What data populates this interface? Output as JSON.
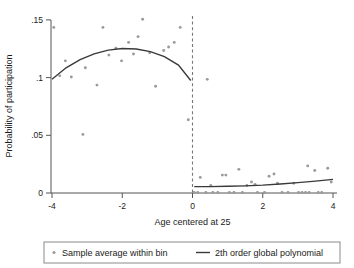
{
  "chart_data": {
    "type": "scatter",
    "title": "",
    "xlabel": "Age centered at 25",
    "ylabel": "Probability of participation",
    "xlim": [
      -4.2,
      4.2
    ],
    "ylim": [
      0,
      0.158
    ],
    "xticks": [
      -4,
      -2,
      0,
      2,
      4
    ],
    "xticklabels": [
      "-4",
      "-2",
      "0",
      "2",
      "4"
    ],
    "yticks": [
      0,
      0.05,
      0.1,
      0.15
    ],
    "yticklabels": [
      "0",
      ".05",
      ".1",
      ".15"
    ],
    "grid": false,
    "cutoff": 0,
    "cutoff_style": "dashed-vertical",
    "legend_position": "below",
    "series": [
      {
        "name": "Sample average within bin",
        "type": "scatter",
        "marker": "dot",
        "color": "#9a9a9a",
        "points": [
          [
            -3.95,
            0.1435
          ],
          [
            -3.78,
            0.1015
          ],
          [
            -3.62,
            0.1145
          ],
          [
            -3.45,
            0.1005
          ],
          [
            -3.12,
            0.0508
          ],
          [
            -3.05,
            0.1085
          ],
          [
            -2.72,
            0.0935
          ],
          [
            -2.55,
            0.1435
          ],
          [
            -2.38,
            0.1195
          ],
          [
            -2.18,
            0.1255
          ],
          [
            -2.02,
            0.1145
          ],
          [
            -1.82,
            0.1305
          ],
          [
            -1.68,
            0.1205
          ],
          [
            -1.55,
            0.1355
          ],
          [
            -1.42,
            0.1505
          ],
          [
            -1.22,
            0.1215
          ],
          [
            -1.05,
            0.0925
          ],
          [
            -0.82,
            0.1235
          ],
          [
            -0.68,
            0.1265
          ],
          [
            -0.52,
            0.1305
          ],
          [
            -0.35,
            0.1435
          ],
          [
            -0.12,
            0.0635
          ],
          [
            0.05,
            0.0005
          ],
          [
            0.15,
            0.0005
          ],
          [
            0.22,
            0.0135
          ],
          [
            0.38,
            0.0005
          ],
          [
            0.52,
            0.0065
          ],
          [
            0.58,
            0.0005
          ],
          [
            0.72,
            0.0005
          ],
          [
            0.85,
            0.0155
          ],
          [
            0.95,
            0.0155
          ],
          [
            1.05,
            0.0005
          ],
          [
            1.18,
            0.0005
          ],
          [
            1.32,
            0.0205
          ],
          [
            1.42,
            0.0005
          ],
          [
            1.55,
            0.0065
          ],
          [
            1.68,
            0.0095
          ],
          [
            1.78,
            0.0075
          ],
          [
            1.85,
            0.0005
          ],
          [
            2.05,
            0.0005
          ],
          [
            2.18,
            0.0145
          ],
          [
            2.32,
            0.0165
          ],
          [
            2.42,
            0.0085
          ],
          [
            2.55,
            0.0005
          ],
          [
            2.72,
            0.0005
          ],
          [
            2.88,
            0.0085
          ],
          [
            3.02,
            0.0005
          ],
          [
            3.12,
            0.0005
          ],
          [
            3.22,
            0.0005
          ],
          [
            3.32,
            0.0005
          ],
          [
            3.28,
            0.0235
          ],
          [
            3.48,
            0.0195
          ],
          [
            3.58,
            0.0005
          ],
          [
            3.68,
            0.0005
          ],
          [
            3.85,
            0.0215
          ],
          [
            3.95,
            0.0095
          ],
          [
            0.42,
            0.0985
          ]
        ]
      },
      {
        "name": "2th order global polynomial",
        "type": "line",
        "color": "#3a3a3a",
        "left_fit": [
          [
            -4.0,
            0.0985
          ],
          [
            -3.6,
            0.1085
          ],
          [
            -3.2,
            0.1155
          ],
          [
            -2.8,
            0.1205
          ],
          [
            -2.4,
            0.1238
          ],
          [
            -2.0,
            0.1252
          ],
          [
            -1.6,
            0.1248
          ],
          [
            -1.2,
            0.1225
          ],
          [
            -0.8,
            0.1182
          ],
          [
            -0.4,
            0.1108
          ],
          [
            -0.05,
            0.0975
          ]
        ],
        "right_fit": [
          [
            0.05,
            0.0055
          ],
          [
            0.5,
            0.0055
          ],
          [
            1.0,
            0.0058
          ],
          [
            1.5,
            0.0062
          ],
          [
            2.0,
            0.0068
          ],
          [
            2.5,
            0.0078
          ],
          [
            3.0,
            0.009
          ],
          [
            3.5,
            0.0103
          ],
          [
            4.0,
            0.0118
          ]
        ]
      }
    ]
  },
  "legend": {
    "items": [
      {
        "label": "Sample average within bin",
        "marker": "dot"
      },
      {
        "label": "2th order global polynomial",
        "marker": "line"
      }
    ]
  },
  "colors": {
    "marker": "#9a9a9a",
    "line": "#3a3a3a",
    "axis": "#555555",
    "cutoff": "#777777",
    "legend_border": "#8a8a8a"
  }
}
